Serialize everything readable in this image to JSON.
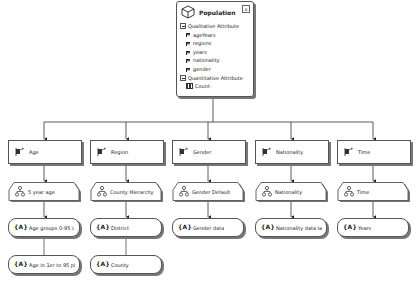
{
  "cube": {
    "title": "Population",
    "close_label": "x",
    "qualitative_header": "Qualitative Attribute",
    "attributes": [
      "ageYears",
      "regions",
      "years",
      "nationality",
      "gender"
    ],
    "quantitative_header": "Quantitative Attribute",
    "measures": [
      "Count"
    ]
  },
  "dimensions": [
    {
      "label": "Age",
      "hierarchy": "5 year age",
      "levels": [
        "Age groups 0-95 i...",
        "Age in 1er to 95 pl..."
      ]
    },
    {
      "label": "Region",
      "hierarchy": "County Hierarchy",
      "levels": [
        "District",
        "County"
      ]
    },
    {
      "label": "Gender",
      "hierarchy": "Gender Default",
      "levels": [
        "Gender data"
      ]
    },
    {
      "label": "Nationality",
      "hierarchy": "Nationality",
      "levels": [
        "Nationality  data la..."
      ]
    },
    {
      "label": "Time",
      "hierarchy": "Time",
      "levels": [
        "Years"
      ]
    }
  ],
  "icons": {
    "cube": "cube-icon",
    "dimension": "dimension-icon",
    "hierarchy": "hierarchy-icon",
    "level": "level-icon",
    "level_glyph": "{A}"
  }
}
